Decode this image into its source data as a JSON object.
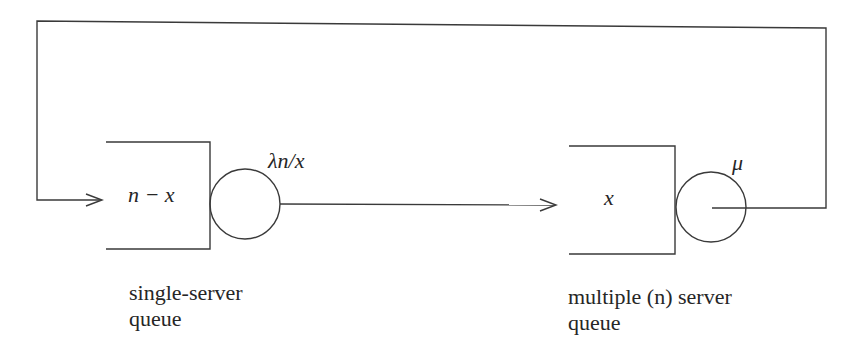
{
  "diagram": {
    "type": "closed queueing network",
    "nodes": [
      {
        "id": "single-server-queue",
        "queue_label": "n − x",
        "rate_label": "λn/x",
        "caption_line1": "single-server",
        "caption_line2": "queue"
      },
      {
        "id": "multi-server-queue",
        "queue_label": "x",
        "rate_label": "μ",
        "caption_line1": "multiple (n) server",
        "caption_line2": "queue"
      }
    ],
    "edges": [
      {
        "from": "single-server-queue",
        "to": "multi-server-queue",
        "arrow": true
      },
      {
        "from": "multi-server-queue",
        "to": "single-server-queue",
        "arrow": true,
        "route": "feedback loop over top"
      }
    ],
    "line_color": "#3a3a3a"
  }
}
